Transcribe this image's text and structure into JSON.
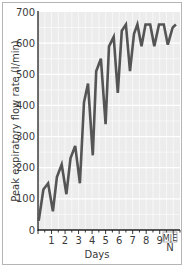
{
  "chart_data": {
    "type": "line",
    "title": "",
    "xlabel": "Days",
    "ylabel": "Peak expiratory flow rate  (l/min)",
    "ylim": [
      0,
      700
    ],
    "xlim": [
      0,
      10.5
    ],
    "yticks": [
      0,
      100,
      200,
      300,
      400,
      500,
      600,
      700
    ],
    "xticks": [
      {
        "value": 1,
        "label": "1"
      },
      {
        "value": 2,
        "label": "2"
      },
      {
        "value": 3,
        "label": "3"
      },
      {
        "value": 4,
        "label": "4"
      },
      {
        "value": 5,
        "label": "5"
      },
      {
        "value": 6,
        "label": "6"
      },
      {
        "value": 7,
        "label": "7"
      },
      {
        "value": 8,
        "label": "8"
      },
      {
        "value": 9,
        "label": "9"
      }
    ],
    "extra_labels": {
      "marker_top": "M|E",
      "marker_bottom": "N"
    },
    "grid": true,
    "legend": null,
    "series": [
      {
        "name": "PEFR",
        "color": "#555555",
        "x": [
          0.05,
          0.4,
          0.75,
          1.1,
          1.4,
          1.75,
          2.1,
          2.4,
          2.75,
          3.1,
          3.4,
          3.7,
          4.05,
          4.3,
          4.65,
          5.0,
          5.25,
          5.6,
          5.9,
          6.2,
          6.5,
          6.8,
          7.1,
          7.35,
          7.65,
          7.95,
          8.3,
          8.6,
          8.95,
          9.3,
          9.6,
          9.95,
          10.2
        ],
        "values": [
          30,
          130,
          150,
          60,
          170,
          210,
          115,
          230,
          270,
          150,
          410,
          470,
          240,
          510,
          550,
          340,
          590,
          620,
          440,
          640,
          660,
          510,
          630,
          660,
          590,
          660,
          660,
          590,
          660,
          660,
          595,
          650,
          660
        ]
      }
    ]
  }
}
